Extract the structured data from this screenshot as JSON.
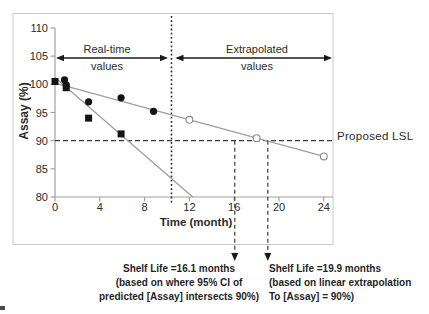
{
  "chart_data": {
    "type": "line",
    "title": "",
    "xlabel": "Time (month)",
    "ylabel": "Assay (%)",
    "xlim": [
      0,
      24
    ],
    "ylim": [
      80,
      110
    ],
    "x_ticks": [
      0,
      4,
      8,
      12,
      16,
      20,
      24
    ],
    "y_ticks": [
      80,
      85,
      90,
      95,
      100,
      105,
      110
    ],
    "grid": false,
    "legend": "none",
    "region_labels": {
      "real_time": {
        "line1": "Real-time",
        "line2": "values"
      },
      "extrapolated": {
        "line1": "Extrapolated",
        "line2": "values"
      },
      "divider_x_month": 10.4
    },
    "series": [
      {
        "name": "real-time-squares",
        "marker": "filled-square",
        "color": "#141414",
        "points": [
          [
            0,
            100.5
          ],
          [
            1,
            99.4
          ],
          [
            3,
            94.0
          ],
          [
            5.9,
            91.2
          ]
        ]
      },
      {
        "name": "real-time-circles",
        "marker": "filled-circle",
        "color": "#141414",
        "points": [
          [
            0.85,
            100.8
          ],
          [
            1,
            99.9
          ],
          [
            3,
            96.9
          ],
          [
            5.9,
            97.6
          ],
          [
            8.8,
            95.2
          ]
        ]
      },
      {
        "name": "extrapolated-open-circles",
        "marker": "open-circle",
        "color": "#8a8a8a",
        "points": [
          [
            12,
            93.7
          ],
          [
            18,
            90.45
          ],
          [
            24,
            87.2
          ]
        ]
      }
    ],
    "trend_lines": [
      {
        "name": "steep-fit-line",
        "from": [
          0,
          101.2
        ],
        "to": [
          12.3,
          80
        ]
      },
      {
        "name": "shallow-fit-line",
        "from": [
          0,
          100.2
        ],
        "to": [
          24,
          87.2
        ]
      }
    ],
    "reference_lines": {
      "proposed_lsl": {
        "value": 90,
        "label": "Proposed LSL"
      }
    },
    "annotations": [
      {
        "name": "shelf-life-ci",
        "x_month": 16.05,
        "lines": [
          "Shelf Life =16.1 months",
          "(based on where 95% CI of",
          "predicted [Assay] intersects 90%)"
        ]
      },
      {
        "name": "shelf-life-extrapolation",
        "x_month": 19.0,
        "lines": [
          "Shelf Life =19.9 months",
          "(based on linear extrapolation",
          "To [Assay] = 90%)"
        ]
      }
    ],
    "colors": {
      "axis": "#a0a0a0",
      "trend": "#9e9e9e",
      "marker": "#141414",
      "dashed": "#3c3c3c",
      "divider": "#222222",
      "arrow": "#1a1a1a",
      "text": "#2b2b2b",
      "frame": "#c8c8c8"
    }
  }
}
